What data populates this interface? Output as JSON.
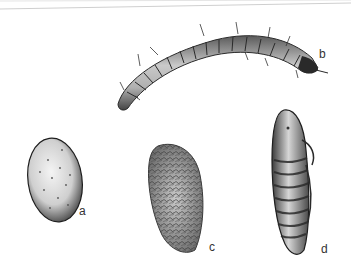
{
  "figure": {
    "labels": {
      "egg": "a",
      "larva": "b",
      "cocoon": "c",
      "pupa": "d"
    },
    "colors": {
      "ink": "#1e1e1e",
      "shade_light": "#e6e6e6",
      "shade_mid": "#a8a8a8",
      "shade_dark": "#555555",
      "rule": "#d0d0d0"
    }
  }
}
